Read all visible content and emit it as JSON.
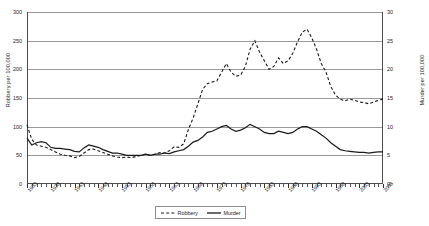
{
  "chart_data": {
    "type": "line",
    "title": "",
    "xlabel": "",
    "ylabel": "Robbery per 100,000",
    "ylabel_right": "Murder per 100,000",
    "ylim": [
      0,
      300
    ],
    "ylim_right": [
      0,
      30
    ],
    "yticks": [
      0,
      50,
      100,
      150,
      200,
      250,
      300
    ],
    "yticks_right": [
      0,
      5,
      10,
      15,
      20,
      25,
      30
    ],
    "grid": true,
    "legend_position": "bottom-center",
    "x_tick_labels": [
      "1933",
      "1938",
      "1943",
      "1948",
      "1953",
      "1958",
      "1963",
      "1968",
      "1973",
      "1978",
      "1983",
      "1988",
      "1993",
      "1998",
      "2003",
      "2008"
    ],
    "x_start": 1933,
    "x_end": 2008,
    "series": [
      {
        "name": "Robbery",
        "axis": "left",
        "style": "dashed",
        "x": [
          1933,
          1934,
          1935,
          1936,
          1937,
          1938,
          1939,
          1940,
          1941,
          1942,
          1943,
          1944,
          1945,
          1946,
          1947,
          1948,
          1949,
          1950,
          1951,
          1952,
          1953,
          1954,
          1955,
          1956,
          1957,
          1958,
          1959,
          1960,
          1961,
          1962,
          1963,
          1964,
          1965,
          1966,
          1967,
          1968,
          1969,
          1970,
          1971,
          1972,
          1973,
          1974,
          1975,
          1976,
          1977,
          1978,
          1979,
          1980,
          1981,
          1982,
          1983,
          1984,
          1985,
          1986,
          1987,
          1988,
          1989,
          1990,
          1991,
          1992,
          1993,
          1994,
          1995,
          1996,
          1997,
          1998,
          1999,
          2000,
          2001,
          2002,
          2003,
          2004,
          2005,
          2006,
          2007,
          2008
        ],
        "values": [
          103,
          78,
          68,
          66,
          64,
          60,
          56,
          52,
          50,
          49,
          46,
          48,
          54,
          60,
          61,
          58,
          55,
          52,
          49,
          47,
          46,
          47,
          46,
          48,
          50,
          52,
          50,
          52,
          55,
          54,
          58,
          65,
          64,
          70,
          95,
          115,
          140,
          165,
          175,
          178,
          180,
          195,
          210,
          195,
          188,
          190,
          205,
          235,
          250,
          230,
          215,
          200,
          205,
          220,
          210,
          215,
          228,
          248,
          265,
          270,
          255,
          235,
          210,
          195,
          170,
          155,
          148,
          145,
          148,
          146,
          143,
          142,
          140,
          143,
          146,
          148
        ],
        "peak_value": 270,
        "peak_year": 1992,
        "start_value": 103,
        "end_value": 148
      },
      {
        "name": "Murder",
        "axis": "right",
        "style": "solid",
        "x": [
          1933,
          1934,
          1935,
          1936,
          1937,
          1938,
          1939,
          1940,
          1941,
          1942,
          1943,
          1944,
          1945,
          1946,
          1947,
          1948,
          1949,
          1950,
          1951,
          1952,
          1953,
          1954,
          1955,
          1956,
          1957,
          1958,
          1959,
          1960,
          1961,
          1962,
          1963,
          1964,
          1965,
          1966,
          1967,
          1968,
          1969,
          1970,
          1971,
          1972,
          1973,
          1974,
          1975,
          1976,
          1977,
          1978,
          1979,
          1980,
          1981,
          1982,
          1983,
          1984,
          1985,
          1986,
          1987,
          1988,
          1989,
          1990,
          1991,
          1992,
          1993,
          1994,
          1995,
          1996,
          1997,
          1998,
          1999,
          2000,
          2001,
          2002,
          2003,
          2004,
          2005,
          2006,
          2007,
          2008
        ],
        "values_left_scale": [
          80,
          68,
          72,
          74,
          72,
          64,
          62,
          62,
          61,
          60,
          57,
          56,
          63,
          68,
          66,
          64,
          60,
          57,
          54,
          54,
          52,
          50,
          50,
          50,
          50,
          52,
          50,
          52,
          52,
          54,
          53,
          56,
          58,
          60,
          66,
          73,
          76,
          82,
          90,
          92,
          96,
          100,
          102,
          96,
          92,
          94,
          98,
          104,
          100,
          96,
          90,
          88,
          88,
          92,
          90,
          88,
          90,
          96,
          100,
          100,
          96,
          92,
          86,
          80,
          72,
          66,
          60,
          58,
          57,
          56,
          55,
          55,
          54,
          55,
          56,
          56
        ],
        "values_right_scale": [
          8.0,
          6.8,
          7.2,
          7.4,
          7.2,
          6.4,
          6.2,
          6.2,
          6.1,
          6.0,
          5.7,
          5.6,
          6.3,
          6.8,
          6.6,
          6.4,
          6.0,
          5.7,
          5.4,
          5.4,
          5.2,
          5.0,
          5.0,
          5.0,
          5.0,
          5.2,
          5.0,
          5.2,
          5.2,
          5.4,
          5.3,
          5.6,
          5.8,
          6.0,
          6.6,
          7.3,
          7.6,
          8.2,
          9.0,
          9.2,
          9.6,
          10.0,
          10.2,
          9.6,
          9.2,
          9.4,
          9.8,
          10.4,
          10.0,
          9.6,
          9.0,
          8.8,
          8.8,
          9.2,
          9.0,
          8.8,
          9.0,
          9.6,
          10.0,
          10.0,
          9.6,
          9.2,
          8.6,
          8.0,
          7.2,
          6.6,
          6.0,
          5.8,
          5.7,
          5.6,
          5.5,
          5.5,
          5.4,
          5.5,
          5.6,
          5.6
        ],
        "peak_value": 10.4,
        "peak_year": 1980,
        "start_value": 8.0,
        "end_value": 5.6
      }
    ],
    "legend": [
      {
        "label": "Robbery",
        "style": "dashed"
      },
      {
        "label": "Murder",
        "style": "solid"
      }
    ],
    "colors": {
      "line": "#1a1a1a",
      "grid": "#9a9a9a",
      "axis": "#4d4d4d",
      "background": "#ffffff"
    }
  }
}
